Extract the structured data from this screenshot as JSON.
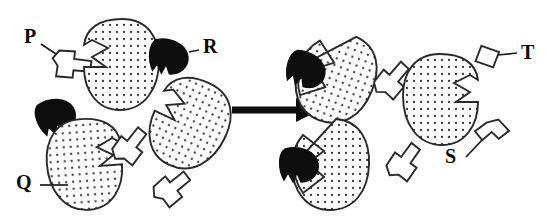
{
  "figure": {
    "type": "reaction-schematic",
    "background_color": "#ffffff",
    "ink_color": "#1a1a1a",
    "fill_ligand_color": "#0d0d0d",
    "fill_protein_color": "#ffffff",
    "protein_texture": "stippled-dots"
  },
  "labels": [
    {
      "id": "P",
      "text": "P",
      "x": 24,
      "y": 26,
      "points_to": "white-angular-fragment-p"
    },
    {
      "id": "R",
      "text": "R",
      "x": 203,
      "y": 36,
      "points_to": "black-wedge-ligand-r"
    },
    {
      "id": "Q",
      "text": "Q",
      "x": 16,
      "y": 180,
      "points_to": "stippled-protein-q"
    },
    {
      "id": "T",
      "text": "T",
      "x": 524,
      "y": 44,
      "points_to": "white-angular-fragment-t"
    },
    {
      "id": "S",
      "text": "S",
      "x": 445,
      "y": 146,
      "points_to": "white-angular-fragment-s"
    }
  ],
  "arrow": {
    "name": "reaction-arrow",
    "direction": "right",
    "x1": 232,
    "y1": 110,
    "x2": 318,
    "y2": 110
  },
  "left_side": {
    "name": "reactants-panel",
    "proteins": [
      {
        "name": "stippled-protein-top",
        "cx": 122,
        "cy": 65,
        "rx": 36,
        "ry": 48,
        "rotation": 0,
        "notch_side": "left",
        "bound": false
      },
      {
        "name": "stippled-protein-q",
        "cx": 84,
        "cy": 165,
        "rx": 35,
        "ry": 46,
        "rotation": -4,
        "notch_side": "right",
        "bound": false
      },
      {
        "name": "stippled-protein-mid",
        "cx": 190,
        "cy": 125,
        "rx": 36,
        "ry": 44,
        "rotation": 25,
        "notch_side": "left",
        "bound": false
      }
    ],
    "ligands": [
      {
        "name": "black-wedge-ligand-r",
        "cx": 172,
        "cy": 55,
        "rotation": 5,
        "state": "free"
      },
      {
        "name": "black-wedge-ligand-free",
        "cx": 58,
        "cy": 113,
        "rotation": -20,
        "state": "free"
      }
    ],
    "fragments": [
      {
        "name": "white-angular-fragment-p",
        "cx": 73,
        "cy": 63,
        "rotation": 30
      },
      {
        "name": "white-angular-fragment-left-1",
        "cx": 130,
        "cy": 144,
        "rotation": -28
      },
      {
        "name": "white-angular-fragment-left-2",
        "cx": 172,
        "cy": 186,
        "rotation": -15
      }
    ]
  },
  "right_side": {
    "name": "products-panel",
    "complexes": [
      {
        "name": "protein-ligand-complex-top",
        "cx": 335,
        "cy": 78,
        "rotation": 20,
        "ligand_position": "left-cleft"
      },
      {
        "name": "protein-ligand-complex-bottom",
        "cx": 330,
        "cy": 165,
        "rotation": 0,
        "ligand_position": "left-cleft"
      }
    ],
    "proteins": [
      {
        "name": "stippled-protein-right-free",
        "cx": 440,
        "cy": 100,
        "rx": 34,
        "ry": 44,
        "rotation": 0,
        "notch_side": "right",
        "bound": false
      }
    ],
    "fragments": [
      {
        "name": "white-angular-fragment-right-1",
        "cx": 392,
        "cy": 78,
        "rotation": -25
      },
      {
        "name": "white-angular-fragment-t",
        "cx": 487,
        "cy": 57,
        "rotation": 35
      },
      {
        "name": "white-angular-fragment-right-2",
        "cx": 404,
        "cy": 160,
        "rotation": -30
      },
      {
        "name": "white-angular-fragment-s",
        "cx": 492,
        "cy": 131,
        "rotation": 20
      }
    ]
  }
}
